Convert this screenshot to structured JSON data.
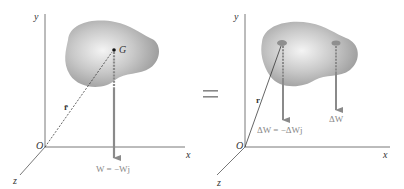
{
  "left_panel": {
    "axis_y": "y",
    "axis_x": "x",
    "axis_z": "z",
    "origin": "O",
    "centroid": "G",
    "position_vector": "r̄",
    "weight_label": "W = −Wj"
  },
  "equals_sign": "=",
  "right_panel": {
    "axis_y": "y",
    "axis_x": "x",
    "axis_z": "z",
    "origin": "O",
    "position_vector": "r",
    "element_weight_label": "ΔW = −ΔWj",
    "element_weight_label_2": "ΔW"
  },
  "colors": {
    "body_fill": "#a9a9a9",
    "body_highlight": "#f2f2f2",
    "arrow": "#8a8a8a",
    "axis": "#555555"
  }
}
